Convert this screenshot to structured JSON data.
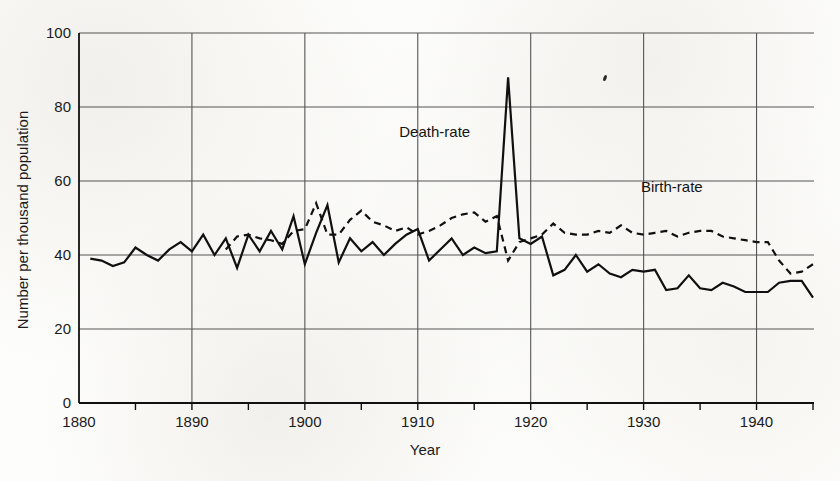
{
  "chart_data": {
    "type": "line",
    "title": "",
    "xlabel": "Year",
    "ylabel": "Number per thousand population",
    "xlim": [
      1880,
      1945
    ],
    "ylim": [
      0,
      100
    ],
    "xticks": [
      1880,
      1890,
      1900,
      1910,
      1920,
      1930,
      1940
    ],
    "xtick_labels": [
      "1880",
      "1890",
      "1900",
      "1910",
      "1920",
      "1930",
      "1940"
    ],
    "xticks_minor": [
      1885,
      1895,
      1905,
      1915,
      1925,
      1935,
      1945
    ],
    "yticks": [
      0,
      20,
      40,
      60,
      80,
      100
    ],
    "ytick_labels": [
      "0",
      "20",
      "40",
      "60",
      "80",
      "100"
    ],
    "grid": "horizontal-at-yticks-and-vertical-at-decades",
    "legend": "inline-annotations",
    "annotations": [
      {
        "text": "Death-rate",
        "x": 1911.5,
        "y": 72,
        "name": "death-rate-label"
      },
      {
        "text": "Birth-rate",
        "x": 1932.5,
        "y": 57,
        "name": "birth-rate-label"
      }
    ],
    "series": [
      {
        "name": "Death-rate",
        "style": "solid",
        "color": "#101010",
        "x": [
          1881,
          1882,
          1883,
          1884,
          1885,
          1886,
          1887,
          1888,
          1889,
          1890,
          1891,
          1892,
          1893,
          1894,
          1895,
          1896,
          1897,
          1898,
          1899,
          1900,
          1901,
          1902,
          1903,
          1904,
          1905,
          1906,
          1907,
          1908,
          1909,
          1910,
          1911,
          1912,
          1913,
          1914,
          1915,
          1916,
          1917,
          1918,
          1919,
          1920,
          1921,
          1922,
          1923,
          1924,
          1925,
          1926,
          1927,
          1928,
          1929,
          1930,
          1931,
          1932,
          1933,
          1934,
          1935,
          1936,
          1937,
          1938,
          1939,
          1940,
          1941,
          1942,
          1943,
          1944,
          1945
        ],
        "values": [
          39.0,
          38.5,
          37.0,
          38.0,
          42.0,
          40.0,
          38.5,
          41.5,
          43.5,
          41.0,
          45.5,
          40.0,
          44.5,
          36.5,
          45.5,
          41.0,
          46.5,
          41.5,
          50.5,
          37.5,
          46.0,
          53.5,
          38.0,
          44.5,
          41.0,
          43.5,
          40.0,
          43.0,
          45.5,
          47.0,
          38.5,
          41.5,
          44.5,
          40.0,
          42.0,
          40.5,
          41.0,
          88.0,
          44.5,
          43.0,
          45.0,
          34.5,
          36.0,
          40.0,
          35.5,
          37.5,
          35.0,
          34.0,
          36.0,
          35.5,
          36.0,
          30.5,
          31.0,
          34.5,
          31.0,
          30.5,
          32.5,
          31.5,
          30.0,
          30.0,
          30.0,
          32.5,
          33.0,
          33.0,
          28.5
        ]
      },
      {
        "name": "Birth-rate",
        "style": "dashed",
        "color": "#101010",
        "x": [
          1893,
          1894,
          1895,
          1896,
          1897,
          1898,
          1899,
          1900,
          1901,
          1902,
          1903,
          1904,
          1905,
          1906,
          1907,
          1908,
          1909,
          1910,
          1911,
          1912,
          1913,
          1914,
          1915,
          1916,
          1917,
          1918,
          1919,
          1920,
          1921,
          1922,
          1923,
          1924,
          1925,
          1926,
          1927,
          1928,
          1929,
          1930,
          1931,
          1932,
          1933,
          1934,
          1935,
          1936,
          1937,
          1938,
          1939,
          1940,
          1941,
          1942,
          1943,
          1944,
          1945
        ],
        "values": [
          41.5,
          45.0,
          45.5,
          44.5,
          44.0,
          43.0,
          46.5,
          47.0,
          54.0,
          45.5,
          45.5,
          49.5,
          52.0,
          49.0,
          48.0,
          46.5,
          47.5,
          45.5,
          46.5,
          48.0,
          50.0,
          51.0,
          51.5,
          49.0,
          50.5,
          38.5,
          43.5,
          44.5,
          45.5,
          48.5,
          46.0,
          45.5,
          45.5,
          46.5,
          46.0,
          48.0,
          46.0,
          45.5,
          46.0,
          46.5,
          45.0,
          46.0,
          46.5,
          46.5,
          45.0,
          44.5,
          44.0,
          43.5,
          43.5,
          38.5,
          35.0,
          35.5,
          37.5
        ]
      }
    ]
  },
  "page": {
    "background_color": "#fdfdfb",
    "ink_color": "#101010",
    "grid_color": "#555555"
  },
  "artifacts": [
    {
      "name": "scan-speck",
      "x": 605,
      "y": 78
    }
  ]
}
